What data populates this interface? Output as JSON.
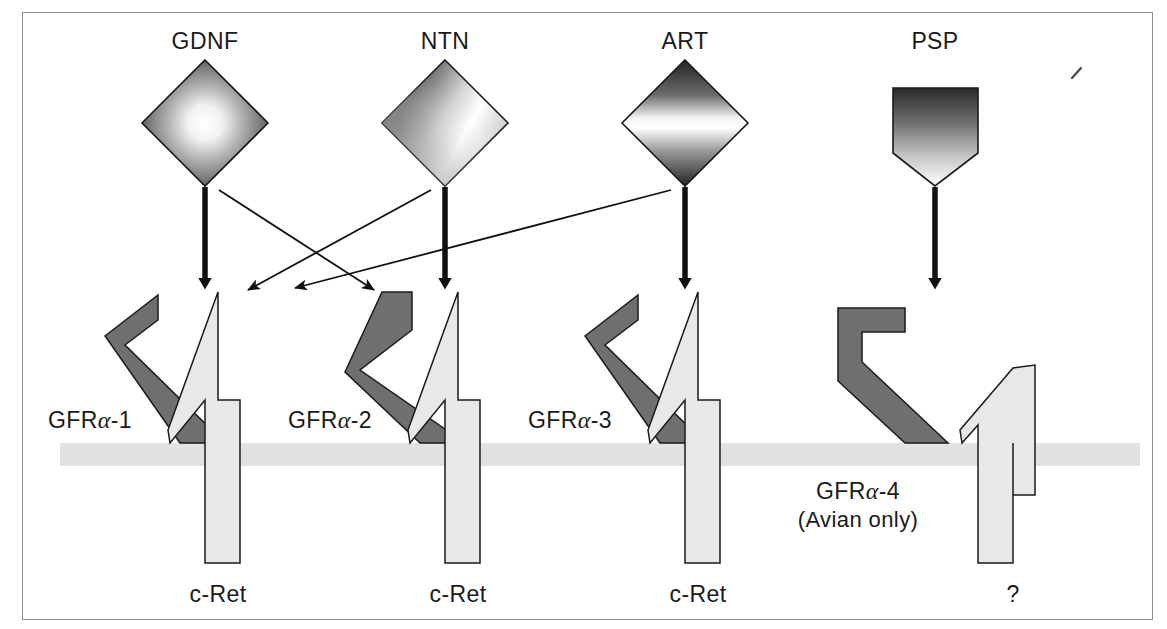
{
  "figure": {
    "title_alt": "GDNF family ligands and GFR-alpha receptor complexes with c-Ret",
    "frame_color": "#8c8c8c",
    "background": "#ffffff"
  },
  "colors": {
    "ligand_dark": "#2b2b2b",
    "ligand_light": "#ffffff",
    "receptor_gray": "#6f6f6f",
    "cret_gray": "#e8e8e8",
    "membrane_gray": "#e0e0e0",
    "outline": "#1a1a1a",
    "arrow_black": "#111111"
  },
  "ligands": [
    {
      "id": "gdnf",
      "label": "GDNF",
      "shape": "diamond",
      "gradient": "radial",
      "cx": 205,
      "cy": 123,
      "label_x": 205,
      "label_y": 45
    },
    {
      "id": "ntn",
      "label": "NTN",
      "shape": "diamond",
      "gradient": "conic",
      "cx": 445,
      "cy": 123,
      "label_x": 445,
      "label_y": 45
    },
    {
      "id": "art",
      "label": "ART",
      "shape": "diamond",
      "gradient": "vertical-band",
      "cx": 685,
      "cy": 123,
      "label_x": 685,
      "label_y": 45
    },
    {
      "id": "psp",
      "label": "PSP",
      "shape": "pentagon-down",
      "gradient": "vertical",
      "cx": 935,
      "cy": 123,
      "label_x": 935,
      "label_y": 45
    }
  ],
  "receptors": [
    {
      "id": "gfra1",
      "label_prefix": "GFR",
      "label_greek": "α",
      "label_suffix": "-1",
      "label_x": 48,
      "label_y": 424,
      "variant": "chevron-angled"
    },
    {
      "id": "gfra2",
      "label_prefix": "GFR",
      "label_greek": "α",
      "label_suffix": "-2",
      "label_x": 288,
      "label_y": 424,
      "variant": "chevron-vertical-arm"
    },
    {
      "id": "gfra3",
      "label_prefix": "GFR",
      "label_greek": "α",
      "label_suffix": "-3",
      "label_x": 528,
      "label_y": 424,
      "variant": "chevron-angled"
    },
    {
      "id": "gfra4",
      "label_prefix": "GFR",
      "label_greek": "α",
      "label_suffix": "-4",
      "label_x": 858,
      "label_y": 494,
      "variant": "bent-bracket",
      "sublabel": "(Avian only)",
      "sublabel_x": 858,
      "sublabel_y": 521
    }
  ],
  "kinases": [
    {
      "id": "cret1",
      "label": "c-Ret",
      "label_x": 218,
      "label_y": 598,
      "variant": "full-arrow"
    },
    {
      "id": "cret2",
      "label": "c-Ret",
      "label_x": 458,
      "label_y": 598,
      "variant": "full-arrow"
    },
    {
      "id": "cret3",
      "label": "c-Ret",
      "label_x": 698,
      "label_y": 598,
      "variant": "full-arrow"
    },
    {
      "id": "cret4",
      "label": "?",
      "label_x": 1013,
      "label_y": 598,
      "variant": "half-arrow"
    }
  ],
  "membrane": {
    "y_top": 443,
    "y_bottom": 466,
    "x_left": 60,
    "x_right": 1140
  },
  "thick_arrows": [
    {
      "id": "arrow-gdnf-down",
      "from_x": 205,
      "from_y": 187,
      "to_x": 205,
      "to_y": 292
    },
    {
      "id": "arrow-ntn-down",
      "from_x": 445,
      "from_y": 187,
      "to_x": 445,
      "to_y": 292
    },
    {
      "id": "arrow-art-down",
      "from_x": 685,
      "from_y": 187,
      "to_x": 685,
      "to_y": 292
    },
    {
      "id": "arrow-psp-down",
      "from_x": 935,
      "from_y": 187,
      "to_x": 935,
      "to_y": 292
    }
  ],
  "thin_arrows": [
    {
      "id": "arrow-gdnf-to-gfra2",
      "from_x": 218,
      "from_y": 190,
      "to_x": 378,
      "to_y": 293
    },
    {
      "id": "arrow-ntn-to-gfra1",
      "from_x": 432,
      "from_y": 190,
      "to_x": 243,
      "to_y": 293
    },
    {
      "id": "arrow-art-to-gfra1",
      "from_x": 672,
      "from_y": 190,
      "to_x": 288,
      "to_y": 289
    }
  ],
  "stray_mark": {
    "id": "stray-mark",
    "x": 1076,
    "y": 72
  }
}
